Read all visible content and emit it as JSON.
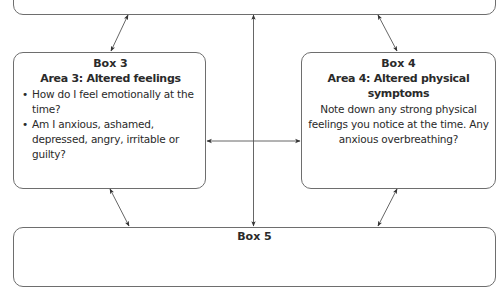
{
  "diagram": {
    "type": "five-areas-cbt-model",
    "boxes": {
      "top": {
        "visible": "bottom-edge-only"
      },
      "box3": {
        "number": "Box 3",
        "title": "Area 3: Altered feelings",
        "bullets": [
          "How do I feel emotionally at the time?",
          "Am I anxious, ashamed, depressed, angry, irritable or guilty?"
        ]
      },
      "box4": {
        "number": "Box 4",
        "title": "Area 4: Altered physical symptoms",
        "body": "Note down any strong physical feelings you notice at the time. Any anxious overbreathing?"
      },
      "box5": {
        "number": "Box 5"
      }
    },
    "connectors": [
      {
        "from": "top",
        "to": "box3",
        "style": "double-arrow"
      },
      {
        "from": "top",
        "to": "box4",
        "style": "double-arrow"
      },
      {
        "from": "box3",
        "to": "box4",
        "style": "double-arrow"
      },
      {
        "from": "top",
        "to": "box5",
        "style": "double-arrow-vertical"
      },
      {
        "from": "box3",
        "to": "box5",
        "style": "double-arrow"
      },
      {
        "from": "box4",
        "to": "box5",
        "style": "double-arrow"
      }
    ],
    "colors": {
      "border": "#6e6e6e",
      "arrow": "#333333",
      "text": "#2a2a2a"
    }
  }
}
